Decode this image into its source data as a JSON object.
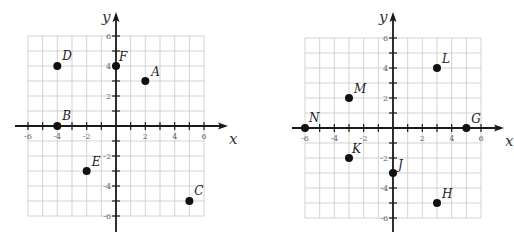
{
  "chart_data": [
    {
      "type": "scatter",
      "title": "",
      "xlabel": "x",
      "ylabel": "y",
      "xlim": [
        -6,
        6
      ],
      "ylim": [
        -6,
        6
      ],
      "grid": true,
      "x_tick_labels": [
        "-6",
        "-4",
        "-2",
        "2",
        "4",
        "6"
      ],
      "y_tick_labels": [
        "6",
        "4",
        "2",
        "-2",
        "-4",
        "-6"
      ],
      "points": [
        {
          "label": "A",
          "x": 2,
          "y": 3
        },
        {
          "label": "B",
          "x": -4,
          "y": 0
        },
        {
          "label": "C",
          "x": 5,
          "y": -5
        },
        {
          "label": "D",
          "x": -4,
          "y": 4
        },
        {
          "label": "E",
          "x": -2,
          "y": -3
        },
        {
          "label": "F",
          "x": 0,
          "y": 4
        }
      ]
    },
    {
      "type": "scatter",
      "title": "",
      "xlabel": "x",
      "ylabel": "y",
      "xlim": [
        -6,
        6
      ],
      "ylim": [
        -6,
        6
      ],
      "grid": true,
      "x_tick_labels": [
        "-6",
        "-4",
        "-2",
        "2",
        "4",
        "6"
      ],
      "y_tick_labels": [
        "6",
        "4",
        "2",
        "-2",
        "-4",
        "-6"
      ],
      "points": [
        {
          "label": "G",
          "x": 5,
          "y": 0
        },
        {
          "label": "H",
          "x": 3,
          "y": -5
        },
        {
          "label": "J",
          "x": 0,
          "y": -3
        },
        {
          "label": "K",
          "x": -3,
          "y": -2
        },
        {
          "label": "L",
          "x": 3,
          "y": 4
        },
        {
          "label": "M",
          "x": -3,
          "y": 2
        },
        {
          "label": "N",
          "x": -6,
          "y": 0
        }
      ]
    }
  ],
  "layout": {
    "planes": [
      {
        "origin_x": 116,
        "origin_y": 126,
        "unit_x": 14.67,
        "unit_y": 15,
        "axis_x_start": 15,
        "axis_x_end": 228,
        "axis_y_top": 12,
        "axis_y_bottom": 232,
        "label_offsets": {
          "A": [
            6,
            -5
          ],
          "B": [
            5,
            -6
          ],
          "C": [
            5,
            -6
          ],
          "D": [
            5,
            -6
          ],
          "E": [
            5,
            -5
          ],
          "F": [
            3,
            -5
          ]
        }
      },
      {
        "origin_x": 393,
        "origin_y": 128,
        "unit_x": 14.67,
        "unit_y": 15,
        "axis_x_start": 292,
        "axis_x_end": 504,
        "axis_y_top": 12,
        "axis_y_bottom": 232,
        "label_offsets": {
          "G": [
            5,
            -5
          ],
          "H": [
            5,
            -5
          ],
          "J": [
            5,
            -4
          ],
          "K": [
            3,
            -5
          ],
          "L": [
            5,
            -5
          ],
          "M": [
            5,
            -5
          ],
          "N": [
            4,
            -6
          ]
        }
      }
    ],
    "colors": {
      "grid": "#c8c8c8",
      "axis": "#1a1a1a",
      "point": "#111111"
    }
  }
}
